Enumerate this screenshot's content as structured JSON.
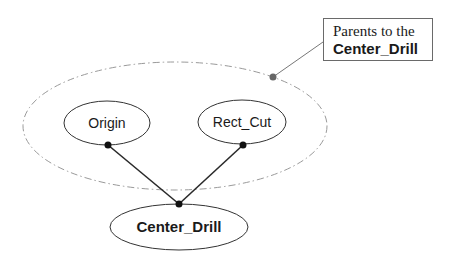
{
  "diagram": {
    "type": "dependency-graph",
    "group": {
      "label": "parent-group",
      "style": "dash-dot",
      "color": "#9a9a9a"
    },
    "nodes": [
      {
        "id": "origin",
        "label": "Origin",
        "bold": false
      },
      {
        "id": "rect_cut",
        "label": "Rect_Cut",
        "bold": false
      },
      {
        "id": "center_drill",
        "label": "Center_Drill",
        "bold": true
      }
    ],
    "edges": [
      {
        "from": "origin",
        "to": "center_drill"
      },
      {
        "from": "rect_cut",
        "to": "center_drill"
      }
    ],
    "callout": {
      "line1": "Parents to the",
      "line2": "Center_Drill",
      "target": "parent-group"
    },
    "colors": {
      "stroke": "#333333",
      "edge": "#2a2a2a",
      "dot": "#111111",
      "callout_dot": "#666666",
      "leader": "#777777"
    }
  }
}
